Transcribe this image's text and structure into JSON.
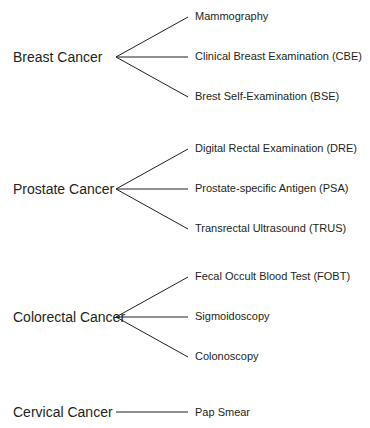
{
  "diagram": {
    "type": "tree",
    "groups": [
      {
        "category": "Breast Cancer",
        "tests": [
          "Mammography",
          "Clinical Breast Examination (CBE)",
          "Brest Self-Examination (BSE)"
        ]
      },
      {
        "category": "Prostate Cancer",
        "tests": [
          "Digital Rectal Examination (DRE)",
          "Prostate-specific Antigen (PSA)",
          "Transrectal Ultrasound (TRUS)"
        ]
      },
      {
        "category": "Colorectal Cancer",
        "tests": [
          "Fecal Occult Blood Test (FOBT)",
          "Sigmoidoscopy",
          "Colonoscopy"
        ]
      },
      {
        "category": "Cervical Cancer",
        "tests": [
          "Pap Smear"
        ]
      }
    ],
    "line_color": "#231f20"
  }
}
